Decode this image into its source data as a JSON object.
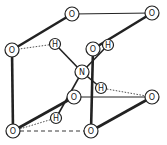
{
  "diagram": {
    "title": "",
    "atoms": [
      {
        "id": "o_top_mid",
        "label": "O",
        "x": 72,
        "y": 14,
        "r": 7
      },
      {
        "id": "o_top_right",
        "label": "O",
        "x": 152,
        "y": 13,
        "r": 7
      },
      {
        "id": "o_left",
        "label": "O",
        "x": 12,
        "y": 50,
        "r": 7
      },
      {
        "id": "o_mid_back",
        "label": "O",
        "x": 93,
        "y": 49,
        "r": 7
      },
      {
        "id": "h_back",
        "label": "H",
        "x": 108,
        "y": 45,
        "r": 5.5
      },
      {
        "id": "h_upper_left",
        "label": "H",
        "x": 55,
        "y": 44,
        "r": 5.5
      },
      {
        "id": "n_center",
        "label": "N",
        "x": 82,
        "y": 72,
        "r": 7
      },
      {
        "id": "h_right",
        "label": "H",
        "x": 101,
        "y": 88,
        "r": 5.5
      },
      {
        "id": "o_mid_low",
        "label": "O",
        "x": 74,
        "y": 97,
        "r": 7
      },
      {
        "id": "o_right_mid",
        "label": "O",
        "x": 152,
        "y": 97,
        "r": 7
      },
      {
        "id": "h_lower",
        "label": "H",
        "x": 56,
        "y": 118,
        "r": 5.5
      },
      {
        "id": "o_bottom_left",
        "label": "O",
        "x": 13,
        "y": 131,
        "r": 7
      },
      {
        "id": "o_bottom_right",
        "label": "O",
        "x": 91,
        "y": 131,
        "r": 7
      }
    ],
    "bonds": [
      {
        "from": "o_top_mid",
        "to": "o_top_right",
        "style": "thin"
      },
      {
        "from": "o_left",
        "to": "o_top_mid",
        "style": "thick"
      },
      {
        "from": "o_left",
        "to": "o_bottom_left",
        "style": "thick"
      },
      {
        "from": "o_mid_back",
        "to": "o_top_right",
        "style": "thick"
      },
      {
        "from": "o_mid_back",
        "to": "o_bottom_right",
        "style": "thick"
      },
      {
        "from": "o_mid_low",
        "to": "o_right_mid",
        "style": "thin"
      },
      {
        "from": "o_bottom_left",
        "to": "o_mid_low",
        "style": "thick"
      },
      {
        "from": "o_bottom_right",
        "to": "o_right_mid",
        "style": "thick"
      },
      {
        "from": "n_center",
        "to": "h_upper_left",
        "style": "medium"
      },
      {
        "from": "n_center",
        "to": "h_back",
        "style": "medium"
      },
      {
        "from": "n_center",
        "to": "h_right",
        "style": "medium"
      },
      {
        "from": "n_center",
        "to": "h_lower",
        "style": "medium"
      }
    ],
    "hydrogen_bonds": [
      {
        "from": "h_upper_left",
        "to": "o_left",
        "style": "dotted"
      },
      {
        "from": "h_right",
        "to": "o_right_mid",
        "style": "dotted"
      },
      {
        "from": "h_lower",
        "to": "o_bottom_left",
        "style": "dotted"
      }
    ],
    "dashed_edges": [
      {
        "from": "o_bottom_left",
        "to": "o_bottom_right",
        "style": "dashed"
      }
    ],
    "colors": {
      "line": "#222222",
      "background": "#ffffff"
    }
  }
}
